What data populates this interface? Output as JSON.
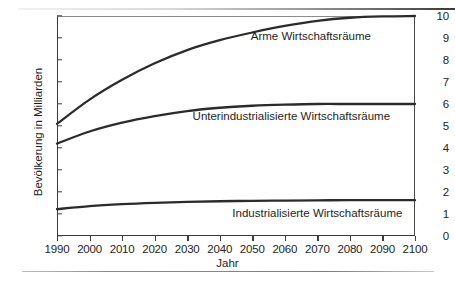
{
  "figure": {
    "background_color": "#ffffff",
    "frame_color": "#3c3c3c",
    "curve_color": "#2b2b2b"
  },
  "chart_data": {
    "type": "line",
    "title": "",
    "subtitle": "",
    "xlabel": "Jahr",
    "ylabel": "Bevölkerung in Milliarden",
    "xlim": [
      1990,
      2100
    ],
    "ylim": [
      0,
      10
    ],
    "grid": false,
    "legend_position": "inline-annotations",
    "xticks": [
      1990,
      2000,
      2010,
      2020,
      2030,
      2040,
      2050,
      2060,
      2070,
      2080,
      2090,
      2100
    ],
    "xtick_labels": [
      "1990",
      "2000",
      "2010",
      "2020",
      "2030",
      "2040",
      "2050",
      "2060",
      "2070",
      "2080",
      "2090",
      "2100"
    ],
    "yticks": [
      0,
      1,
      2,
      3,
      4,
      5,
      6,
      7,
      8,
      9,
      10
    ],
    "ytick_labels": [
      "0",
      "1",
      "2",
      "3",
      "4",
      "5",
      "6",
      "7",
      "8",
      "9",
      "10"
    ],
    "x": [
      1990,
      2000,
      2010,
      2020,
      2030,
      2040,
      2050,
      2060,
      2070,
      2080,
      2090,
      2100
    ],
    "series": [
      {
        "name": "Arme Wirtschaftsräume",
        "label_x": 2068,
        "label_y": 9.1,
        "values": [
          5.1,
          6.2,
          7.1,
          7.85,
          8.45,
          8.9,
          9.25,
          9.55,
          9.78,
          9.92,
          9.98,
          10.0
        ]
      },
      {
        "name": "Unterindustrialisierte Wirtschaftsräume",
        "label_x": 2062,
        "label_y": 5.45,
        "values": [
          4.2,
          4.75,
          5.15,
          5.45,
          5.68,
          5.83,
          5.92,
          5.97,
          6.0,
          6.0,
          6.0,
          6.0
        ]
      },
      {
        "name": "Industrialisierte Wirtschaftsräume",
        "label_x": 2070,
        "label_y": 1.05,
        "values": [
          1.22,
          1.36,
          1.45,
          1.51,
          1.55,
          1.58,
          1.6,
          1.61,
          1.62,
          1.63,
          1.63,
          1.63
        ]
      }
    ],
    "annotations": [
      "Arme Wirtschaftsräume",
      "Unterindustrialisierte Wirtschaftsräume",
      "Industrialisierte Wirtschaftsräume"
    ]
  }
}
